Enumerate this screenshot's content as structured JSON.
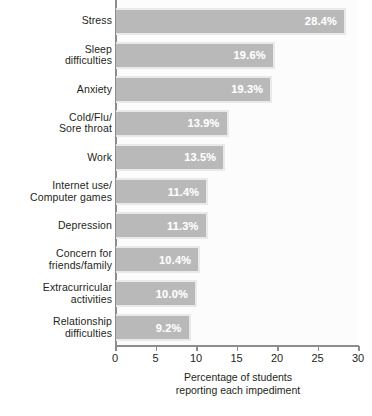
{
  "chart_data": {
    "type": "bar",
    "orientation": "horizontal",
    "title": "",
    "xlabel_line1": "Percentage of students",
    "xlabel_line2": "reporting  each impediment",
    "ylabel": "",
    "xlim": [
      0,
      30
    ],
    "xticks": [
      0,
      5,
      10,
      15,
      20,
      25,
      30
    ],
    "xtick_labels": [
      "0",
      "5",
      "10",
      "15",
      "20",
      "25",
      "30"
    ],
    "grid": false,
    "legend": null,
    "categories": [
      "Stress",
      "Sleep difficulties",
      "Anxiety",
      "Cold/Flu/ Sore throat",
      "Work",
      "Internet use/ Computer games",
      "Depression",
      "Concern for friends/family",
      "Extracurricular activities",
      "Relationship difficulties"
    ],
    "category_lines": [
      [
        "Stress"
      ],
      [
        "Sleep",
        "difficulties"
      ],
      [
        "Anxiety"
      ],
      [
        "Cold/Flu/",
        "Sore throat"
      ],
      [
        "Work"
      ],
      [
        "Internet use/",
        "Computer games"
      ],
      [
        "Depression"
      ],
      [
        "Concern for",
        "friends/family"
      ],
      [
        "Extracurricular",
        "activities"
      ],
      [
        "Relationship",
        "difficulties"
      ]
    ],
    "values": [
      28.4,
      19.6,
      19.3,
      13.9,
      13.5,
      11.4,
      11.3,
      10.4,
      10.0,
      9.2
    ],
    "value_labels": [
      "28.4%",
      "19.6%",
      "19.3%",
      "13.9%",
      "13.5%",
      "11.4%",
      "11.3%",
      "10.4%",
      "10.0%",
      "9.2%"
    ],
    "colors": {
      "bar_fill": "#b9b9b9",
      "bar_border": "#e9e9e9",
      "value_text": "#ffffff",
      "axis": "#8c8c8c",
      "text": "#231f20",
      "plot_background": "#fcfcfc",
      "page_background": "#ffffff"
    }
  }
}
